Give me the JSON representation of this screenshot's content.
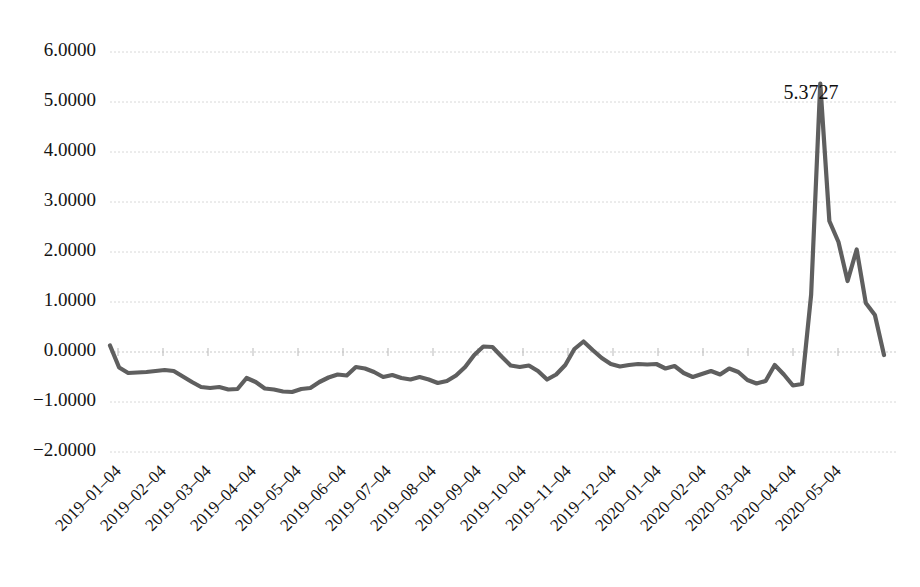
{
  "chart_data": {
    "type": "line",
    "title": "",
    "subtitle": "",
    "xlabel": "",
    "ylabel": "",
    "grid": true,
    "legend": false,
    "legend_position": "none",
    "series_color": "#5f5f5f",
    "xlim_labels": [
      "2019-01-04",
      "2020-05-04"
    ],
    "ylim": [
      -2.0,
      6.0
    ],
    "ytick_labels": [
      "6.0000",
      "5.0000",
      "4.0000",
      "3.0000",
      "2.0000",
      "1.0000",
      "0.0000",
      "-1.0000",
      "-2.0000"
    ],
    "ytick_values": [
      6.0,
      5.0,
      4.0,
      3.0,
      2.0,
      1.0,
      0.0,
      -1.0,
      -2.0
    ],
    "xtick_labels": [
      "2019-01-04",
      "2019-02-04",
      "2019-03-04",
      "2019-04-04",
      "2019-05-04",
      "2019-06-04",
      "2019-07-04",
      "2019-08-04",
      "2019-09-04",
      "2019-10-04",
      "2019-11-04",
      "2019-12-04",
      "2020-01-04",
      "2020-02-04",
      "2020-03-04",
      "2020-04-04",
      "2020-05-04"
    ],
    "annotations": [
      {
        "name": "peak-value-label",
        "text": "5.3727",
        "x_index": 72,
        "value": 5.3727
      }
    ],
    "x": [
      0,
      1,
      2,
      3,
      4,
      5,
      6,
      7,
      8,
      9,
      10,
      11,
      12,
      13,
      14,
      15,
      16,
      17,
      18,
      19,
      20,
      21,
      22,
      23,
      24,
      25,
      26,
      27,
      28,
      29,
      30,
      31,
      32,
      33,
      34,
      35,
      36,
      37,
      38,
      39,
      40,
      41,
      42,
      43,
      44,
      45,
      46,
      47,
      48,
      49,
      50,
      51,
      52,
      53,
      54,
      55,
      56,
      57,
      58,
      59,
      60,
      61,
      62,
      63,
      64,
      65,
      66,
      67,
      68,
      69,
      70,
      71,
      72,
      73,
      74,
      75,
      76,
      77,
      78,
      79,
      80,
      81,
      82,
      83,
      84,
      85
    ],
    "values": [
      0.13,
      -0.31,
      -0.42,
      -0.41,
      -0.4,
      -0.38,
      -0.36,
      -0.38,
      -0.49,
      -0.6,
      -0.7,
      -0.72,
      -0.7,
      -0.75,
      -0.74,
      -0.52,
      -0.6,
      -0.73,
      -0.75,
      -0.79,
      -0.8,
      -0.74,
      -0.72,
      -0.6,
      -0.51,
      -0.45,
      -0.47,
      -0.3,
      -0.33,
      -0.4,
      -0.5,
      -0.46,
      -0.52,
      -0.55,
      -0.5,
      -0.55,
      -0.62,
      -0.58,
      -0.47,
      -0.3,
      -0.06,
      0.11,
      0.1,
      -0.09,
      -0.27,
      -0.3,
      -0.27,
      -0.38,
      -0.55,
      -0.45,
      -0.26,
      0.06,
      0.21,
      0.04,
      -0.12,
      -0.24,
      -0.29,
      -0.26,
      -0.24,
      -0.25,
      -0.24,
      -0.33,
      -0.28,
      -0.42,
      -0.5,
      -0.44,
      -0.38,
      -0.45,
      -0.33,
      -0.4,
      -0.56,
      -0.63,
      -0.58,
      -0.26,
      -0.45,
      -0.67,
      -0.64,
      1.15,
      5.37,
      2.62,
      2.2,
      1.42,
      2.05,
      0.98,
      0.74,
      -0.06
    ]
  }
}
